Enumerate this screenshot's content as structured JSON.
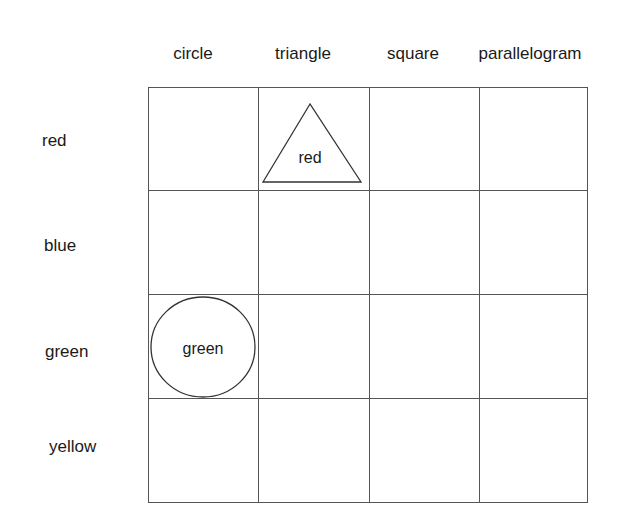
{
  "columns": [
    "circle",
    "triangle",
    "square",
    "parallelogram"
  ],
  "rows": [
    "red",
    "blue",
    "green",
    "yellow"
  ],
  "cells": [
    {
      "row": "red",
      "column": "triangle",
      "shape": "triangle",
      "label": "red"
    },
    {
      "row": "green",
      "column": "circle",
      "shape": "circle",
      "label": "green"
    }
  ],
  "colors": {
    "line": "#555555",
    "text": "#1a1a1a"
  }
}
